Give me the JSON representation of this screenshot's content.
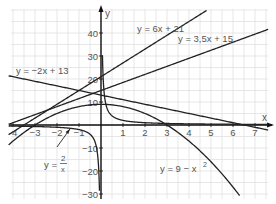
{
  "chart_data": {
    "type": "line",
    "title": "",
    "xlabel": "x",
    "ylabel": "y",
    "xlim": [
      -4.2,
      7.6
    ],
    "ylim": [
      -31,
      50
    ],
    "grid": true,
    "x_ticks": [
      -4,
      -3,
      -2,
      -1,
      1,
      2,
      3,
      4,
      5,
      6,
      7
    ],
    "x_tick_labels": [
      "-4",
      "−3",
      "−2",
      "−1",
      "1",
      "2",
      "3",
      "4",
      "5",
      "6",
      "7"
    ],
    "y_ticks": [
      40,
      30,
      20,
      10,
      -10,
      -20,
      -30
    ],
    "y_tick_labels": [
      "40",
      "30",
      "20",
      "10",
      "−10",
      "−20",
      "−30"
    ],
    "series": [
      {
        "name": "y = 6x + 21",
        "kind": "linear",
        "m": 6,
        "b": 21
      },
      {
        "name": "y = 3,5x + 15",
        "kind": "linear",
        "m": 3.5,
        "b": 15
      },
      {
        "name": "y = −2x + 13",
        "kind": "linear",
        "m": -2,
        "b": 13
      },
      {
        "name": "y = 2/x",
        "kind": "reciprocal",
        "k": 2
      },
      {
        "name": "y = 9 − x²",
        "kind": "quadratic",
        "a": -1,
        "c": 9
      }
    ],
    "annotations": [
      {
        "text": "y = 6x + 21",
        "at": [
          1.8,
          45
        ]
      },
      {
        "text": "y = 3,5x + 15",
        "at": [
          3.5,
          37
        ]
      },
      {
        "text": "y = −2x + 13",
        "at": [
          -4,
          21
        ]
      },
      {
        "text": "y = 2/x",
        "at": [
          -2.4,
          -12
        ],
        "arrow_to": [
          -1.9,
          -1.05
        ]
      },
      {
        "text": "y = 9 − x²",
        "at": [
          2.2,
          -19
        ]
      }
    ]
  },
  "labels": {
    "x_axis": "x",
    "y_axis": "y",
    "line1": "y = 6x + 21",
    "line2": "y = 3,5x + 15",
    "line3": "y = −2x + 13",
    "recip_y": "y =",
    "recip_num": "2",
    "recip_den": "x",
    "parabola": "y = 9 − x",
    "parabola_exp": "2"
  }
}
